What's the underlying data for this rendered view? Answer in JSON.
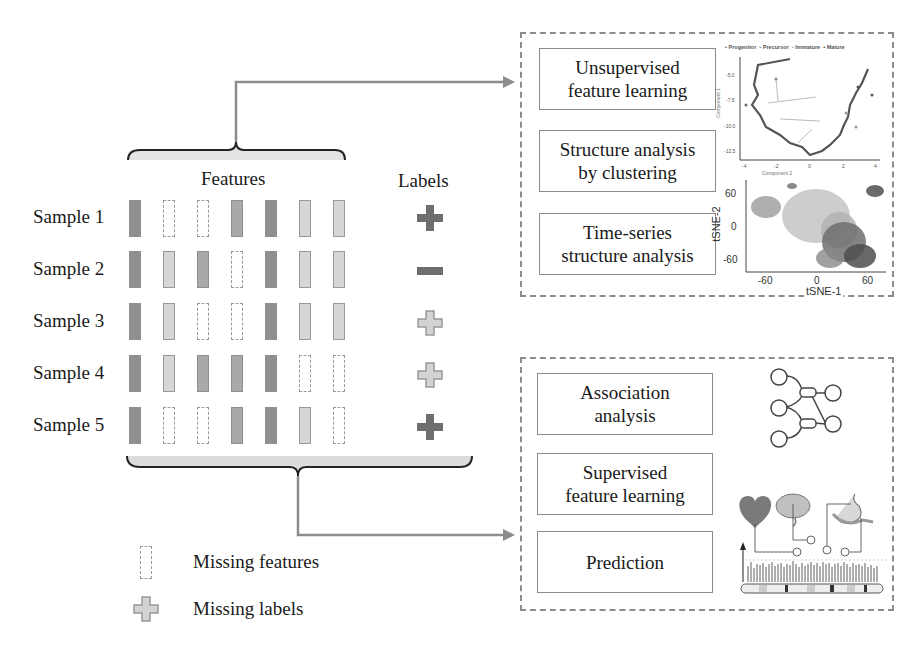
{
  "matrix": {
    "features_header": "Features",
    "labels_header": "Labels",
    "samples": [
      {
        "name": "Sample 1",
        "cells": [
          "dark",
          "missing",
          "missing",
          "mid",
          "dark",
          "light",
          "light"
        ],
        "label": "plus"
      },
      {
        "name": "Sample 2",
        "cells": [
          "dark",
          "light",
          "mid",
          "missing",
          "dark",
          "light",
          "light"
        ],
        "label": "minus"
      },
      {
        "name": "Sample 3",
        "cells": [
          "dark",
          "light",
          "missing",
          "missing",
          "dark",
          "light",
          "light"
        ],
        "label": "plus-missing"
      },
      {
        "name": "Sample 4",
        "cells": [
          "dark",
          "light",
          "mid",
          "mid",
          "dark",
          "missing",
          "missing"
        ],
        "label": "plus-missing"
      },
      {
        "name": "Sample 5",
        "cells": [
          "dark",
          "missing",
          "missing",
          "mid",
          "dark",
          "light",
          "missing"
        ],
        "label": "plus"
      }
    ]
  },
  "legend": {
    "missing_features": "Missing features",
    "missing_labels": "Missing labels"
  },
  "unsupervised_panel": {
    "tasks": [
      {
        "line1": "Unsupervised",
        "line2": "feature learning"
      },
      {
        "line1": "Structure analysis",
        "line2": "by clustering"
      },
      {
        "line1": "Time-series",
        "line2": "structure analysis"
      }
    ],
    "trajectory_plot": {
      "legend": [
        "Progenitor",
        "Precursor",
        "Immature",
        "Mature"
      ],
      "ylabel": "Component 1",
      "xlabel": "Component 2",
      "yticks": [
        "-5.0",
        "-7.5",
        "-10.0",
        "-12.5"
      ],
      "xticks": [
        "-4",
        "-2",
        "0",
        "2",
        "4"
      ]
    },
    "tsne_plot": {
      "ylabel": "tSNE-2",
      "xlabel": "tSNE-1",
      "yticks": [
        "60",
        "0",
        "-60"
      ],
      "xticks": [
        "-60",
        "0",
        "60"
      ]
    }
  },
  "supervised_panel": {
    "tasks": [
      {
        "line1": "Association",
        "line2": "analysis"
      },
      {
        "line1": "Supervised",
        "line2": "feature learning"
      },
      {
        "line1": "Prediction",
        "line2": ""
      }
    ]
  },
  "colors": {
    "arrow": "#8c8c8c",
    "panel_border": "#8c8c8c",
    "dark_cell": "#8f8f8f",
    "mid_cell": "#a9a9a9",
    "light_cell": "#d6d6d6",
    "label_dark": "#6e6e6e",
    "label_missing": "#d0d0d0"
  }
}
